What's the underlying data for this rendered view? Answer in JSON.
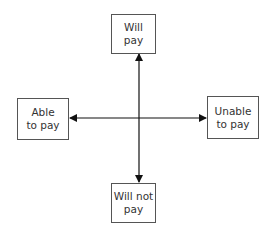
{
  "diagram": {
    "type": "quadrant-axes",
    "nodes": {
      "top": "Will\npay",
      "bottom": "Will not\npay",
      "left": "Able\nto pay",
      "right": "Unable\nto pay"
    },
    "edges": [
      {
        "from": "center",
        "to": "top",
        "arrow": true
      },
      {
        "from": "center",
        "to": "bottom",
        "arrow": true
      },
      {
        "from": "center",
        "to": "left",
        "arrow": true
      },
      {
        "from": "center",
        "to": "right",
        "arrow": true
      }
    ],
    "line_color": "#111111",
    "box_border_color": "#555555"
  }
}
